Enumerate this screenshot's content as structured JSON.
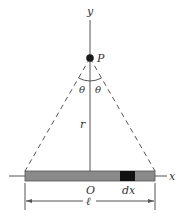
{
  "diagram": {
    "labels": {
      "y_axis": "y",
      "x_axis": "x",
      "point": "P",
      "theta_left": "θ",
      "theta_right": "θ",
      "distance": "r",
      "origin": "O",
      "element": "dx",
      "length": "ℓ"
    },
    "colors": {
      "rod_fill": "#8a8a8a",
      "rod_stroke": "#555555",
      "element_fill": "#111111",
      "point_fill": "#1a1a1a",
      "line": "#555555",
      "text": "#333333"
    }
  }
}
